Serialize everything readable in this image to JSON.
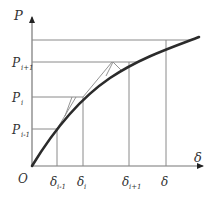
{
  "diagram": {
    "type": "load-displacement incremental iteration (P-δ curve)",
    "axes": {
      "y_label": "P",
      "x_label": "δ",
      "origin_label": "O"
    },
    "y_ticks": [
      {
        "main": "P",
        "sub": "i+1"
      },
      {
        "main": "P",
        "sub": "i"
      },
      {
        "main": "P",
        "sub": "i-1"
      }
    ],
    "x_ticks": [
      {
        "main": "δ",
        "sub": "i-1"
      },
      {
        "main": "δ",
        "sub": "i"
      },
      {
        "main": "δ",
        "sub": "i+1"
      },
      {
        "main": "δ",
        "sub": ""
      }
    ],
    "colors": {
      "curve": "#2b2b2b",
      "grid_lines": "#8a8a8a",
      "axes": "#666666",
      "text": "#333333"
    }
  }
}
